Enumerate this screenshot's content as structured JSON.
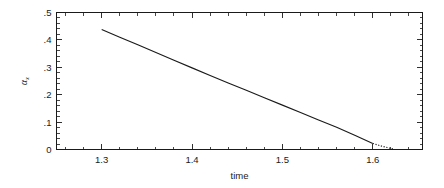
{
  "figure": {
    "background_color": "#ffffff",
    "line_color": "#1a1a1a",
    "text_color": "#1a1a1a"
  },
  "chart_data": {
    "type": "line",
    "title": "",
    "subtitle": "",
    "xlabel": "time",
    "ylabel": "αx",
    "ylabel_base": "α",
    "ylabel_subscript": "x",
    "xlim": [
      1.25,
      1.655
    ],
    "ylim": [
      0.0,
      0.5
    ],
    "grid": false,
    "legend": "none",
    "x_major_ticks": [
      1.3,
      1.4,
      1.5,
      1.6
    ],
    "x_major_tick_labels": [
      "1.3",
      "1.4",
      "1.5",
      "1.6"
    ],
    "x_minor_tick_step": 0.02,
    "y_major_ticks": [
      0,
      0.1,
      0.2,
      0.3,
      0.4,
      0.5
    ],
    "y_major_tick_labels": [
      "0",
      ".1",
      ".2",
      ".3",
      ".4",
      ".5"
    ],
    "y_minor_tick_step": 0.02,
    "ticks_direction": "in",
    "ticks_on_all_sides": true,
    "series": [
      {
        "name": "alpha_x solid",
        "style": "solid",
        "x": [
          1.3,
          1.32,
          1.34,
          1.36,
          1.38,
          1.4,
          1.42,
          1.44,
          1.46,
          1.48,
          1.5,
          1.52,
          1.54,
          1.56,
          1.58,
          1.6
        ],
        "y": [
          0.438,
          0.41,
          0.382,
          0.354,
          0.326,
          0.298,
          0.27,
          0.243,
          0.216,
          0.189,
          0.162,
          0.135,
          0.108,
          0.081,
          0.052,
          0.022
        ]
      },
      {
        "name": "alpha_x dotted tail",
        "style": "dotted",
        "x": [
          1.6,
          1.608,
          1.616,
          1.624
        ],
        "y": [
          0.022,
          0.014,
          0.007,
          0.001
        ]
      }
    ]
  }
}
